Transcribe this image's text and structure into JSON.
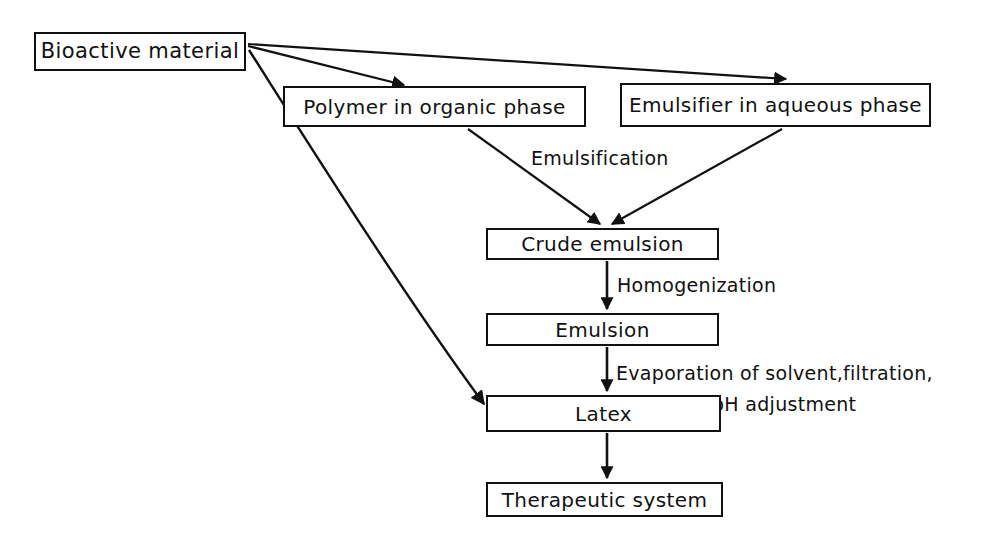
{
  "diagram": {
    "background_color": "#ffffff",
    "line_color": "#111111",
    "nodes": [
      {
        "id": "bioactive",
        "label": "Bioactive material"
      },
      {
        "id": "polymer",
        "label": "Polymer in organic phase"
      },
      {
        "id": "emulsifier",
        "label": "Emulsifier in aqueous phase"
      },
      {
        "id": "crude",
        "label": "Crude emulsion"
      },
      {
        "id": "emulsion",
        "label": "Emulsion"
      },
      {
        "id": "latex",
        "label": "Latex"
      },
      {
        "id": "therapeutic",
        "label": "Therapeutic system"
      }
    ],
    "edge_labels": {
      "emulsification": "Emulsification",
      "homogenization": "Homogenization",
      "evaporation": "Evaporation of solvent,filtration,",
      "ph_adjustment": "pH adjustment"
    },
    "edges": [
      {
        "from": "bioactive",
        "to": "polymer",
        "label": ""
      },
      {
        "from": "bioactive",
        "to": "emulsifier",
        "label": ""
      },
      {
        "from": "bioactive",
        "to": "latex",
        "label": ""
      },
      {
        "from": "polymer",
        "to": "crude",
        "label": "Emulsification"
      },
      {
        "from": "emulsifier",
        "to": "crude",
        "label": "Emulsification"
      },
      {
        "from": "crude",
        "to": "emulsion",
        "label": "Homogenization"
      },
      {
        "from": "emulsion",
        "to": "latex",
        "label": "Evaporation of solvent,filtration, pH adjustment"
      },
      {
        "from": "latex",
        "to": "therapeutic",
        "label": ""
      }
    ],
    "caption": ""
  }
}
